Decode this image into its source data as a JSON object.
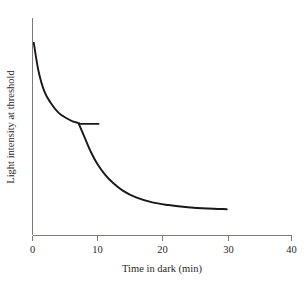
{
  "chart_data": {
    "type": "line",
    "title": "",
    "subtitle": "",
    "xlabel": "Time in dark (min)",
    "ylabel": "Light intensity at threshold",
    "xlim": [
      0,
      40
    ],
    "ylim": [
      0,
      1
    ],
    "xticks": [
      0,
      10,
      20,
      30,
      40
    ],
    "xtick_labels": [
      "0",
      "10",
      "20",
      "30",
      "40"
    ],
    "yticks": [],
    "ytick_labels": [],
    "grid": false,
    "legend": false,
    "legend_position": "none",
    "annotations": [],
    "series": [
      {
        "name": "Cone branch",
        "note": "Rapid early fall in threshold, plateauing near 7 min",
        "x": [
          0.2,
          0.9,
          1.8,
          2.8,
          4.0,
          5.2,
          6.2,
          7.0,
          7.2
        ],
        "y": [
          0.885,
          0.76,
          0.665,
          0.61,
          0.565,
          0.54,
          0.525,
          0.518,
          0.516
        ]
      },
      {
        "name": "Cone plateau extension",
        "note": "Short horizontal segment continuing the cone plateau past the rod-cone break",
        "x": [
          7.2,
          10.2
        ],
        "y": [
          0.513,
          0.513
        ]
      },
      {
        "name": "Rod branch",
        "note": "Second steep fall after the rod-cone break, levelling off by 30 min",
        "x": [
          7.2,
          8.0,
          9.0,
          10.0,
          11.2,
          12.5,
          14.0,
          16.0,
          18.5,
          21.0,
          24.0,
          27.0,
          30.0
        ],
        "y": [
          0.51,
          0.455,
          0.385,
          0.33,
          0.28,
          0.24,
          0.205,
          0.175,
          0.152,
          0.14,
          0.13,
          0.124,
          0.121
        ]
      }
    ],
    "colors": {
      "curve": "#1a1718",
      "axis": "#7d7a78",
      "background": "#ffffff",
      "text": "#2b2726"
    }
  }
}
